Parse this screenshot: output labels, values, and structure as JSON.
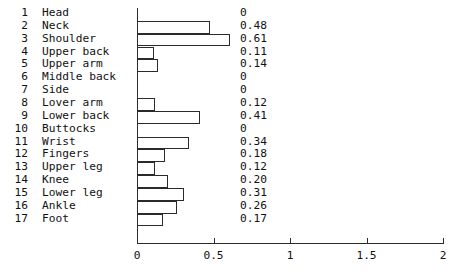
{
  "chart_data": {
    "type": "bar",
    "orientation": "horizontal",
    "title": "",
    "xlabel": "",
    "ylabel": "",
    "xlim": [
      0,
      2
    ],
    "grid": false,
    "legend": null,
    "xticks": [
      "0",
      "0.5",
      "1",
      "1.5",
      "2"
    ],
    "xtick_values": [
      0,
      0.5,
      1,
      1.5,
      2
    ],
    "indices": [
      "1",
      "2",
      "3",
      "4",
      "5",
      "6",
      "7",
      "8",
      "9",
      "10",
      "11",
      "12",
      "13",
      "14",
      "15",
      "16",
      "17"
    ],
    "categories": [
      "Head",
      "Neck",
      "Shoulder",
      "Upper back",
      "Upper arm",
      "Middle back",
      "Side",
      "Lover arm",
      "Lower back",
      "Buttocks",
      "Wrist",
      "Fingers",
      "Upper leg",
      "Knee",
      "Lower leg",
      "Ankle",
      "Foot"
    ],
    "values": [
      0,
      0.48,
      0.61,
      0.11,
      0.14,
      0,
      0,
      0.12,
      0.41,
      0,
      0.34,
      0.18,
      0.12,
      0.2,
      0.31,
      0.26,
      0.17
    ],
    "value_labels": [
      "0",
      "0.48",
      "0.61",
      "0.11",
      "0.14",
      "0",
      "0",
      "0.12",
      "0.41",
      "0",
      "0.34",
      "0.18",
      "0.12",
      "0.20",
      "0.31",
      "0.26",
      "0.17"
    ]
  },
  "style": {
    "bar_fill": "#ffffff",
    "bar_stroke": "#2b2b2b",
    "axis_color": "#2b2b2b",
    "text_color": "#111111",
    "background": "#ffffff"
  }
}
